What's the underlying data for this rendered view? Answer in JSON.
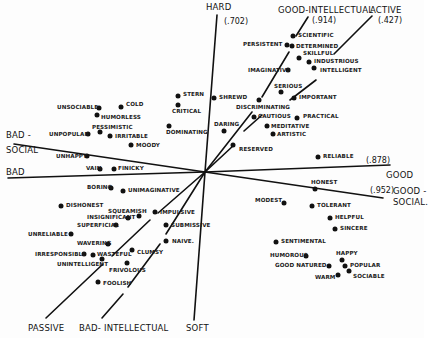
{
  "diagram": {
    "type": "vector-space trait diagram",
    "origin": [
      205,
      172
    ],
    "axes": [
      {
        "id": "hard-soft",
        "label_pos": "HARD",
        "value": "(.702)",
        "label_neg": "SOFT",
        "segments": [
          [
            [
              217,
              15
            ],
            [
              205,
              172
            ]
          ],
          [
            [
              205,
              172
            ],
            [
              194,
              320
            ]
          ]
        ]
      },
      {
        "id": "good-bad",
        "label_pos": "GOOD",
        "value": "(.878)",
        "label_neg": "BAD",
        "segments": [
          [
            [
              8,
              178
            ],
            [
              205,
              172
            ]
          ],
          [
            [
              205,
              172
            ],
            [
              390,
              165
            ]
          ]
        ]
      },
      {
        "id": "good-social",
        "label_pos": "GOOD-SOCIAL",
        "value": "(.952)",
        "label_neg": "BAD-SOCIAL",
        "segments": [
          [
            [
              14,
              144
            ],
            [
              205,
              172
            ]
          ],
          [
            [
              205,
              172
            ],
            [
              383,
              198
            ]
          ]
        ]
      },
      {
        "id": "good-intellectual",
        "label_pos": "GOOD-INTELLECTUAL",
        "value": "(.914)",
        "label_neg": "BAD-INTELLECTUAL",
        "segments": [
          [
            [
              308,
              17
            ],
            [
              296,
              36
            ]
          ],
          [
            [
              289,
              52
            ],
            [
              262,
              97
            ]
          ],
          [
            [
              252,
              112
            ],
            [
              205,
              172
            ]
          ],
          [
            [
              205,
              172
            ],
            [
              166,
              234
            ]
          ],
          [
            [
              160,
              244
            ],
            [
              128,
              287
            ]
          ],
          [
            [
              123,
              294
            ],
            [
              102,
              318
            ]
          ]
        ]
      },
      {
        "id": "active-passive",
        "label_pos": "ACTIVE",
        "value": "(.427)",
        "label_neg": "PASSIVE",
        "segments": [
          [
            [
              372,
              16
            ],
            [
              334,
              54
            ]
          ],
          [
            [
              316,
              80
            ],
            [
              290,
              100
            ]
          ],
          [
            [
              262,
              115
            ],
            [
              244,
              131
            ]
          ],
          [
            [
              234,
              145
            ],
            [
              205,
              172
            ]
          ],
          [
            [
              205,
              172
            ],
            [
              158,
              213
            ]
          ],
          [
            [
              150,
              220
            ],
            [
              112,
              256
            ]
          ],
          [
            [
              103,
              264
            ],
            [
              46,
              318
            ]
          ]
        ]
      }
    ],
    "axis_labels": [
      {
        "text": "HARD",
        "x": 206,
        "y": 2
      },
      {
        "text": "(.702)",
        "x": 224,
        "y": 17
      },
      {
        "text": "GOOD-INTELLECTUAL",
        "x": 278,
        "y": 5
      },
      {
        "text": "(.914)",
        "x": 312,
        "y": 16
      },
      {
        "text": "ACTIVE",
        "x": 370,
        "y": 5
      },
      {
        "text": "(.427)",
        "x": 378,
        "y": 16
      },
      {
        "text": "BAD -",
        "x": 6,
        "y": 130
      },
      {
        "text": "SOCIAL",
        "x": 6,
        "y": 145
      },
      {
        "text": "BAD",
        "x": 6,
        "y": 167
      },
      {
        "text": "(.878)",
        "x": 366,
        "y": 156
      },
      {
        "text": "GOOD",
        "x": 386,
        "y": 170
      },
      {
        "text": "(.952)",
        "x": 370,
        "y": 186
      },
      {
        "text": "GOOD -",
        "x": 393,
        "y": 186
      },
      {
        "text": "SOCIAL.",
        "x": 393,
        "y": 197
      },
      {
        "text": "PASSIVE",
        "x": 28,
        "y": 323
      },
      {
        "text": "BAD- INTELLECTUAL",
        "x": 79,
        "y": 323
      },
      {
        "text": "SOFT",
        "x": 186,
        "y": 323
      }
    ],
    "traits": [
      {
        "name": "scientific",
        "text": "SCIENTIFIC",
        "dot": [
          293,
          36
        ],
        "lx": 298,
        "ly": 32
      },
      {
        "name": "persistent",
        "text": "PERSISTENT",
        "dot": [
          287,
          45
        ],
        "lx": 243,
        "ly": 41
      },
      {
        "name": "determined",
        "text": "DETERMINED",
        "dot": [
          292,
          46
        ],
        "lx": 296,
        "ly": 43
      },
      {
        "name": "skillful",
        "text": "SKILLFUL",
        "dot": [
          299,
          58
        ],
        "lx": 303,
        "ly": 50
      },
      {
        "name": "industrious",
        "text": "INDUSTRIOUS",
        "dot": [
          309,
          62
        ],
        "lx": 314,
        "ly": 58
      },
      {
        "name": "intelligent",
        "text": "INTELLIGENT",
        "dot": [
          314,
          68
        ],
        "lx": 320,
        "ly": 67
      },
      {
        "name": "imaginative",
        "text": "IMAGINATIVE",
        "dot": [
          288,
          70
        ],
        "lx": 248,
        "ly": 67
      },
      {
        "name": "serious",
        "text": "SERIOUS",
        "dot": [
          281,
          92
        ],
        "lx": 274,
        "ly": 83
      },
      {
        "name": "important",
        "text": "IMPORTANT",
        "dot": [
          294,
          98
        ],
        "lx": 299,
        "ly": 94
      },
      {
        "name": "stern",
        "text": "STERN",
        "dot": [
          178,
          96
        ],
        "lx": 183,
        "ly": 91
      },
      {
        "name": "critical",
        "text": "CRITICAL",
        "dot": [
          178,
          105
        ],
        "lx": 172,
        "ly": 108
      },
      {
        "name": "shrewd",
        "text": "SHREWD",
        "dot": [
          214,
          98
        ],
        "lx": 219,
        "ly": 94
      },
      {
        "name": "discriminating",
        "text": "DISCRIMINATING",
        "dot": [
          259,
          100
        ],
        "lx": 236,
        "ly": 104
      },
      {
        "name": "cautious",
        "text": "CAUTIOUS",
        "dot": [
          254,
          117
        ],
        "lx": 258,
        "ly": 113
      },
      {
        "name": "practical",
        "text": "PRACTICAL",
        "dot": [
          297,
          118
        ],
        "lx": 303,
        "ly": 113
      },
      {
        "name": "meditative",
        "text": "MEDITATIVE",
        "dot": [
          267,
          126
        ],
        "lx": 271,
        "ly": 123
      },
      {
        "name": "artistic",
        "text": "ARTISTIC",
        "dot": [
          273,
          134
        ],
        "lx": 277,
        "ly": 131
      },
      {
        "name": "daring",
        "text": "DARING",
        "dot": [
          224,
          131
        ],
        "lx": 214,
        "ly": 121
      },
      {
        "name": "dominating",
        "text": "DOMINATING",
        "dot": [
          169,
          126
        ],
        "lx": 166,
        "ly": 129
      },
      {
        "name": "reserved",
        "text": "RESERVED",
        "dot": [
          233,
          145
        ],
        "lx": 239,
        "ly": 146
      },
      {
        "name": "reliable",
        "text": "RELIABLE",
        "dot": [
          318,
          157
        ],
        "lx": 323,
        "ly": 153
      },
      {
        "name": "unsociable",
        "text": "UNSOCIABLE",
        "dot": [
          99,
          108
        ],
        "lx": 57,
        "ly": 104
      },
      {
        "name": "cold",
        "text": "COLD",
        "dot": [
          121,
          107
        ],
        "lx": 126,
        "ly": 101
      },
      {
        "name": "humorless",
        "text": "HUMORLESS",
        "dot": [
          97,
          115
        ],
        "lx": 101,
        "ly": 114
      },
      {
        "name": "pessimistic",
        "text": "PESSIMISTIC",
        "dot": [
          100,
          132
        ],
        "lx": 92,
        "ly": 124
      },
      {
        "name": "unpopular",
        "text": "UNPOPULAR",
        "dot": [
          88,
          134
        ],
        "lx": 49,
        "ly": 131
      },
      {
        "name": "irritable",
        "text": "IRRITABLE",
        "dot": [
          110,
          136
        ],
        "lx": 115,
        "ly": 133
      },
      {
        "name": "moody",
        "text": "MOODY",
        "dot": [
          131,
          145
        ],
        "lx": 136,
        "ly": 142
      },
      {
        "name": "unhappy",
        "text": "UNHAPPY",
        "dot": [
          87,
          156
        ],
        "lx": 56,
        "ly": 153
      },
      {
        "name": "vain",
        "text": "VAIN",
        "dot": [
          100,
          169
        ],
        "lx": 86,
        "ly": 165
      },
      {
        "name": "finicky",
        "text": "FINICKY",
        "dot": [
          114,
          169
        ],
        "lx": 118,
        "ly": 165
      },
      {
        "name": "boring",
        "text": "BORING",
        "dot": [
          111,
          188
        ],
        "lx": 87,
        "ly": 184
      },
      {
        "name": "unimaginative",
        "text": "UNIMAGINATIVE",
        "dot": [
          123,
          191
        ],
        "lx": 128,
        "ly": 187
      },
      {
        "name": "dishonest",
        "text": "DISHONEST",
        "dot": [
          61,
          206
        ],
        "lx": 66,
        "ly": 202
      },
      {
        "name": "squeamish",
        "text": "SQUEAMISH",
        "dot": [
          139,
          216
        ],
        "lx": 108,
        "ly": 208
      },
      {
        "name": "insignificant",
        "text": "INSIGNIFICANT",
        "dot": [
          128,
          218
        ],
        "lx": 87,
        "ly": 214
      },
      {
        "name": "impulsive",
        "text": "IMPULSIVE",
        "dot": [
          155,
          212
        ],
        "lx": 160,
        "ly": 209
      },
      {
        "name": "superficial",
        "text": "SUPERFICIAL",
        "dot": [
          116,
          225
        ],
        "lx": 77,
        "ly": 222
      },
      {
        "name": "submissive",
        "text": "SUBMISSIVE",
        "dot": [
          166,
          225
        ],
        "lx": 171,
        "ly": 222
      },
      {
        "name": "unreliable",
        "text": "UNRELIABLE",
        "dot": [
          71,
          234
        ],
        "lx": 28,
        "ly": 231
      },
      {
        "name": "naive",
        "text": "NAIVE.",
        "dot": [
          166,
          241
        ],
        "lx": 172,
        "ly": 238
      },
      {
        "name": "wavering",
        "text": "WAVERING",
        "dot": [
          108,
          244
        ],
        "lx": 77,
        "ly": 240
      },
      {
        "name": "clumsy",
        "text": "CLUMSY",
        "dot": [
          132,
          250
        ],
        "lx": 137,
        "ly": 249
      },
      {
        "name": "irresponsible",
        "text": "IRRESPONSIBLE",
        "dot": [
          84,
          254
        ],
        "lx": 35,
        "ly": 251
      },
      {
        "name": "wasteful",
        "text": "WASTEFUL",
        "dot": [
          93,
          255
        ],
        "lx": 97,
        "ly": 251
      },
      {
        "name": "unintelligent",
        "text": "UNINTELLIGENT",
        "dot": [
          102,
          259
        ],
        "lx": 57,
        "ly": 261
      },
      {
        "name": "frivolous",
        "text": "FRIVOLOUS",
        "dot": [
          127,
          263
        ],
        "lx": 109,
        "ly": 267
      },
      {
        "name": "foolish",
        "text": "FOOLISH",
        "dot": [
          98,
          282
        ],
        "lx": 103,
        "ly": 280
      },
      {
        "name": "honest",
        "text": "HONEST",
        "dot": [
          315,
          189
        ],
        "lx": 311,
        "ly": 179
      },
      {
        "name": "modest",
        "text": "MODEST",
        "dot": [
          284,
          203
        ],
        "lx": 255,
        "ly": 197
      },
      {
        "name": "tolerant",
        "text": "TOLERANT",
        "dot": [
          312,
          206
        ],
        "lx": 317,
        "ly": 202
      },
      {
        "name": "helpful",
        "text": "HELPFUL",
        "dot": [
          330,
          218
        ],
        "lx": 335,
        "ly": 214
      },
      {
        "name": "sincere",
        "text": "SINCERE",
        "dot": [
          335,
          229
        ],
        "lx": 340,
        "ly": 225
      },
      {
        "name": "sentimental",
        "text": "SENTIMENTAL",
        "dot": [
          276,
          242
        ],
        "lx": 281,
        "ly": 238
      },
      {
        "name": "humorous",
        "text": "HUMOROUS",
        "dot": [
          306,
          256
        ],
        "lx": 270,
        "ly": 252
      },
      {
        "name": "happy",
        "text": "HAPPY",
        "dot": [
          342,
          260
        ],
        "lx": 336,
        "ly": 250
      },
      {
        "name": "good-natured",
        "text": "GOOD NATURED",
        "dot": [
          329,
          266
        ],
        "lx": 275,
        "ly": 262
      },
      {
        "name": "popular",
        "text": "POPULAR",
        "dot": [
          345,
          266
        ],
        "lx": 350,
        "ly": 262
      },
      {
        "name": "sociable",
        "text": "SOCIABLE",
        "dot": [
          349,
          271
        ],
        "lx": 353,
        "ly": 273
      },
      {
        "name": "warm",
        "text": "WARM",
        "dot": [
          338,
          275
        ],
        "lx": 315,
        "ly": 274
      }
    ]
  }
}
